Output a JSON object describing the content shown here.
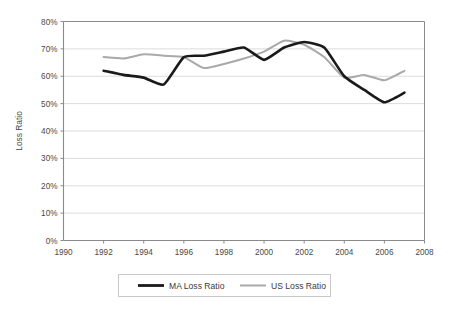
{
  "chart_data": {
    "type": "line",
    "title": "",
    "xlabel": "",
    "ylabel": "Loss Ratio",
    "xlim": [
      1990,
      2008
    ],
    "ylim": [
      0,
      0.8
    ],
    "xticks": [
      "1990",
      "1992",
      "1994",
      "1996",
      "1998",
      "2000",
      "2002",
      "2004",
      "2006",
      "2008"
    ],
    "xtick_values": [
      1990,
      1992,
      1994,
      1996,
      1998,
      2000,
      2002,
      2004,
      2006,
      2008
    ],
    "yticks": [
      "0%",
      "10%",
      "20%",
      "30%",
      "40%",
      "50%",
      "60%",
      "70%",
      "80%"
    ],
    "ytick_values": [
      0,
      10,
      20,
      30,
      40,
      50,
      60,
      70,
      80
    ],
    "grid": true,
    "grid_axis": "y",
    "legend_position": "bottom",
    "x": [
      1992,
      1993,
      1994,
      1995,
      1996,
      1997,
      1998,
      1999,
      2000,
      2001,
      2002,
      2003,
      2004,
      2005,
      2006,
      2007
    ],
    "series": [
      {
        "name": "MA Loss Ratio",
        "color": "#1a1a1a",
        "line_width": 2.6,
        "values": [
          62.0,
          60.5,
          59.5,
          57.0,
          67.0,
          67.5,
          69.0,
          70.5,
          66.0,
          70.5,
          72.5,
          70.5,
          60.0,
          55.0,
          50.5,
          54.0
        ]
      },
      {
        "name": "US Loss Ratio",
        "color": "#a9a9a9",
        "line_width": 2.0,
        "values": [
          67.0,
          66.5,
          68.0,
          67.5,
          67.0,
          63.0,
          64.5,
          66.5,
          69.0,
          73.0,
          71.5,
          67.0,
          59.5,
          60.5,
          58.5,
          62.0
        ]
      }
    ]
  },
  "legend": {
    "items": [
      {
        "label": "MA Loss Ratio",
        "color": "#1a1a1a",
        "line_width": 2.8
      },
      {
        "label": "US Loss Ratio",
        "color": "#a9a9a9",
        "line_width": 2.0
      }
    ]
  },
  "style": {
    "axis_color": "#8a8a8a",
    "grid_color": "#d8d8d8",
    "legend_border": "#c9c9c9",
    "background": "#ffffff",
    "tick_color": "#4a4a4a"
  }
}
